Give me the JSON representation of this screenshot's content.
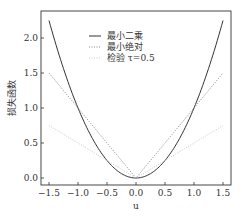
{
  "chart_data": {
    "type": "line",
    "title": "",
    "xlabel": "u",
    "ylabel": "损失函数",
    "xlim": [
      -1.6,
      1.6
    ],
    "ylim": [
      -0.03,
      2.35
    ],
    "xticks": [
      -1.5,
      -1.0,
      -0.5,
      0.0,
      0.5,
      1.0,
      1.5
    ],
    "xtick_labels": [
      "−1.5",
      "−1.0",
      "−0.5",
      "0.0",
      "0.5",
      "1.0",
      "1.5"
    ],
    "yticks": [
      0.0,
      0.5,
      1.0,
      1.5,
      2.0
    ],
    "ytick_labels": [
      "0.0",
      "0.5",
      "1.0",
      "1.5",
      "2.0"
    ],
    "grid": false,
    "legend_position": "upper center",
    "x": [
      -1.5,
      -1.25,
      -1.0,
      -0.75,
      -0.5,
      -0.25,
      0.0,
      0.25,
      0.5,
      0.75,
      1.0,
      1.25,
      1.5
    ],
    "series": [
      {
        "name": "最小二乘",
        "style": "solid",
        "color": "#333333",
        "values": [
          2.25,
          1.5625,
          1.0,
          0.5625,
          0.25,
          0.0625,
          0.0,
          0.0625,
          0.25,
          0.5625,
          1.0,
          1.5625,
          2.25
        ]
      },
      {
        "name": "最小绝对",
        "style": "dotted",
        "color": "#888888",
        "values": [
          1.5,
          1.25,
          1.0,
          0.75,
          0.5,
          0.25,
          0.0,
          0.25,
          0.5,
          0.75,
          1.0,
          1.25,
          1.5
        ]
      },
      {
        "name": "检验 τ=0.5",
        "style": "dotted",
        "color": "#c8c8c8",
        "values": [
          0.75,
          0.625,
          0.5,
          0.375,
          0.25,
          0.125,
          0.0,
          0.125,
          0.25,
          0.375,
          0.5,
          0.625,
          0.75
        ]
      }
    ]
  },
  "legend": {
    "items": [
      {
        "label": "最小二乘"
      },
      {
        "label": "最小绝对"
      },
      {
        "label": "检验 τ=0.5"
      }
    ]
  }
}
